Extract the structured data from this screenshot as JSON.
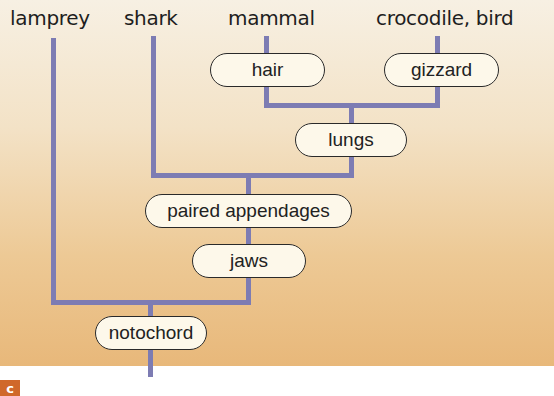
{
  "diagram": {
    "type": "cladogram",
    "taxa": [
      {
        "id": "lamprey",
        "label": "lamprey"
      },
      {
        "id": "shark",
        "label": "shark"
      },
      {
        "id": "mammal",
        "label": "mammal"
      },
      {
        "id": "crocodile_bird",
        "label": "crocodile, bird"
      }
    ],
    "characters": {
      "hair": "hair",
      "gizzard": "gizzard",
      "lungs": "lungs",
      "paired_appendages": "paired appendages",
      "jaws": "jaws",
      "notochord": "notochord"
    },
    "panel_label": "c",
    "colors": {
      "line": "#7d7cb3",
      "pill_fill": "#fdf8ea",
      "pill_border": "#2a2a2a",
      "background_top": "#f7f0e3",
      "background_bottom": "#e8b87a",
      "badge": "#d0682a"
    }
  }
}
